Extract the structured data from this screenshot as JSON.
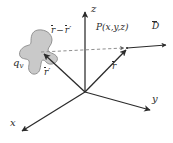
{
  "figure": {
    "kind": "vector-diagram",
    "background_color": "#ffffff",
    "line_color": "#2b2b2b",
    "blob_fill_color": "#c9c9c9",
    "blob_stroke_color": "#8a8a8a",
    "dashed_color": "#8f8f8f",
    "axes": [
      {
        "id": "x",
        "label": "x",
        "label_x": 10,
        "label_y": 121
      },
      {
        "id": "y",
        "label": "y",
        "label_x": 152,
        "label_y": 96
      },
      {
        "id": "z",
        "label": "z",
        "label_x": 91,
        "label_y": 6
      }
    ],
    "origin": {
      "x": 85,
      "y": 92
    },
    "point": {
      "label_prefix": "P",
      "label_args": "(x,y,z)",
      "label_x": 97,
      "label_y": 28,
      "x": 128,
      "y": 49
    },
    "vectors": [
      {
        "id": "r-prime",
        "label_base": "r",
        "label_prime": "′",
        "overbar": true,
        "label_x": 45,
        "label_y": 72,
        "from": {
          "x": 85,
          "y": 92
        },
        "to": {
          "x": 45,
          "y": 53
        },
        "style": "solid"
      },
      {
        "id": "r",
        "label_base": "r",
        "label_prime": "",
        "overbar": true,
        "label_x": 112,
        "label_y": 66,
        "from": {
          "x": 85,
          "y": 92
        },
        "to": {
          "x": 128,
          "y": 50
        },
        "style": "solid"
      },
      {
        "id": "r-minus-r-prime",
        "label_base": "r",
        "label_minus": "−",
        "label_second": "r",
        "label_prime": "′",
        "overbar": true,
        "label_x": 53,
        "label_y": 30,
        "from": {
          "x": 42,
          "y": 51
        },
        "to": {
          "x": 127,
          "y": 49
        },
        "style": "dashed"
      },
      {
        "id": "D",
        "label_base": "D",
        "overbar": true,
        "label_x": 152,
        "label_y": 26,
        "from": {
          "x": 128,
          "y": 49
        },
        "to": {
          "x": 168,
          "y": 45
        },
        "style": "solid"
      }
    ],
    "charge": {
      "label_base": "q",
      "label_sub": "v",
      "label_x": 14,
      "label_y": 62
    }
  }
}
